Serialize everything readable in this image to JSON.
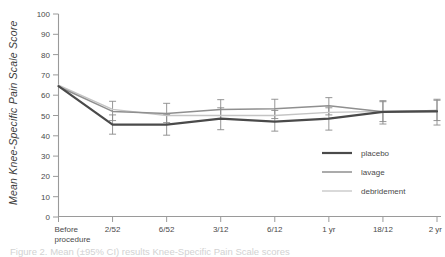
{
  "figure": {
    "y_axis_title": "Mean Knee-Specific Pain Scale Score",
    "caption": "Figure 2. Mean (±95% CI) results Knee-Specific Pain Scale scores"
  },
  "legend": {
    "position": "inside-lower-right",
    "items": [
      {
        "label": "placebo",
        "color": "#4a4a4a",
        "width": 2.2
      },
      {
        "label": "lavage",
        "color": "#8f8f8f",
        "width": 1.5
      },
      {
        "label": "debridement",
        "color": "#c4c4c4",
        "width": 1.3
      }
    ]
  },
  "chart_data": {
    "type": "line",
    "title": "",
    "xlabel": "",
    "ylabel": "Mean Knee-Specific Pain Scale Score",
    "ylim": [
      0,
      100
    ],
    "ytick_step": 10,
    "yticks": [
      0,
      10,
      20,
      30,
      40,
      50,
      60,
      70,
      80,
      90,
      100
    ],
    "grid": false,
    "error_bars": "95% CI",
    "categories": [
      "Before procedure",
      "2/52",
      "6/52",
      "3/12",
      "6/12",
      "1 yr",
      "18/12",
      "2 yr"
    ],
    "xtick_labels": [
      [
        "Before",
        "procedure"
      ],
      [
        "2/52"
      ],
      [
        "6/52"
      ],
      [
        "3/12"
      ],
      [
        "6/12"
      ],
      [
        "1 yr"
      ],
      [
        "18/12"
      ],
      [
        "2 yr"
      ]
    ],
    "series": [
      {
        "name": "placebo",
        "color": "#4a4a4a",
        "width": 2.2,
        "values": [
          64.5,
          45.5,
          45.5,
          48.5,
          47.0,
          48.5,
          51.8,
          52.0
        ],
        "err_low": [
          null,
          40.8,
          40.3,
          43.0,
          42.3,
          42.8,
          45.8,
          45.3
        ],
        "err_high": [
          null,
          50.3,
          50.5,
          53.8,
          52.5,
          53.8,
          57.3,
          58.0
        ]
      },
      {
        "name": "lavage",
        "color": "#8f8f8f",
        "width": 1.5,
        "values": [
          64.3,
          52.0,
          51.0,
          53.0,
          53.3,
          54.8,
          51.9,
          52.5
        ],
        "err_low": [
          null,
          47.5,
          46.5,
          48.5,
          48.5,
          50.3,
          47.0,
          47.5
        ],
        "err_high": [
          null,
          57.0,
          56.0,
          57.8,
          58.0,
          58.8,
          56.8,
          57.5
        ]
      },
      {
        "name": "debridement",
        "color": "#c4c4c4",
        "width": 1.3,
        "values": [
          65.0,
          53.0,
          50.0,
          50.0,
          50.0,
          51.5,
          52.0,
          52.0
        ],
        "err_low": [
          null,
          null,
          null,
          null,
          null,
          null,
          null,
          null
        ],
        "err_high": [
          null,
          null,
          null,
          null,
          null,
          null,
          null,
          null
        ]
      }
    ]
  }
}
